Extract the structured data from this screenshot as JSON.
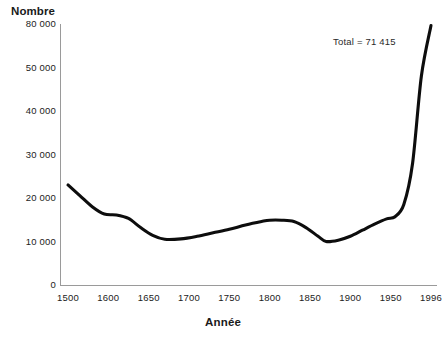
{
  "chart_data": {
    "type": "line",
    "title": "",
    "xlabel": "Année",
    "ylabel": "Nombre",
    "annotation": "Total = 71 415",
    "grid": false,
    "legend": false,
    "x_tick_labels": [
      "1500",
      "1600",
      "1650",
      "1700",
      "1750",
      "1800",
      "1850",
      "1900",
      "1950",
      "1996"
    ],
    "y_tick_labels": [
      "80 000",
      "50 000",
      "40 000",
      "30 000",
      "20 000",
      "10 000",
      "0"
    ],
    "y_tick_values": [
      80000,
      50000,
      40000,
      30000,
      20000,
      10000,
      0
    ],
    "x": [
      1500,
      1530,
      1560,
      1590,
      1610,
      1625,
      1640,
      1655,
      1670,
      1690,
      1710,
      1730,
      1750,
      1770,
      1790,
      1800,
      1815,
      1830,
      1845,
      1860,
      1870,
      1885,
      1900,
      1915,
      1930,
      1945,
      1955,
      1965,
      1975,
      1985,
      1996
    ],
    "values": [
      23000,
      20500,
      18000,
      16300,
      16100,
      15300,
      13200,
      11400,
      10500,
      10600,
      11200,
      12000,
      12800,
      13800,
      14600,
      14900,
      14900,
      14600,
      13200,
      11200,
      10000,
      10300,
      11200,
      12600,
      14000,
      15200,
      15700,
      18500,
      28000,
      48000,
      79000
    ],
    "xlim": [
      1500,
      1996
    ],
    "ylim": [
      0,
      80000
    ],
    "series_color": "#0d0d0d",
    "axis_color": "#9a9a9a",
    "background": "#ffffff"
  },
  "axis_titles": {
    "y": "Nombre",
    "x": "Année"
  }
}
